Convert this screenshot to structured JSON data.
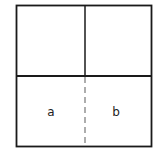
{
  "diagram": {
    "labels": {
      "a": "a",
      "b": "b"
    },
    "colors": {
      "stroke": "#1a1a1a",
      "dashed": "#777777",
      "background": "#ffffff"
    }
  }
}
